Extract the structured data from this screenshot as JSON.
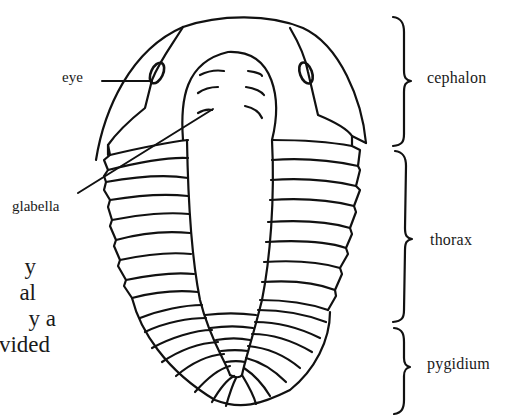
{
  "figure": {
    "stroke_color": "#111111",
    "background": "#ffffff"
  },
  "labels": {
    "eye": "eye",
    "glabella": "glabella",
    "cephalon": "cephalon",
    "thorax": "thorax",
    "pygidium": "pygidium"
  },
  "body_text_fragments": [
    "y",
    "al",
    "y a",
    "vided"
  ]
}
